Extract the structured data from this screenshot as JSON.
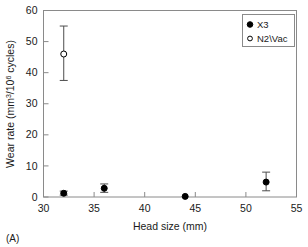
{
  "chart_data": {
    "type": "scatter",
    "title": "",
    "panel_label": "(A)",
    "xlabel": "Head size (mm)",
    "ylabel": "Wear rate (mm3/106 cycles)",
    "ylabel_parts": {
      "lead": "Wear rate (mm",
      "sup1": "3",
      "mid": "/10",
      "sup2": "6",
      "tail": " cycles)"
    },
    "xlim": [
      30,
      55
    ],
    "ylim": [
      0,
      60
    ],
    "xticks": [
      30,
      35,
      40,
      45,
      50,
      55
    ],
    "yticks": [
      0,
      10,
      20,
      30,
      40,
      50,
      60
    ],
    "xtick_labels": [
      "30",
      "35",
      "40",
      "45",
      "50",
      "55"
    ],
    "ytick_labels": [
      "0",
      "10",
      "20",
      "30",
      "40",
      "50",
      "60"
    ],
    "grid": false,
    "legend_position": "top-right",
    "series": [
      {
        "name": "X3",
        "marker": "filled-circle",
        "color": "#000000",
        "points": [
          {
            "x": 32,
            "y": 1.2,
            "yerr_low": 0.6,
            "yerr_high": 1.9
          },
          {
            "x": 36,
            "y": 2.8,
            "yerr_low": 1.5,
            "yerr_high": 4.2
          },
          {
            "x": 44,
            "y": 0.2,
            "yerr_low": 0.2,
            "yerr_high": 0.2
          },
          {
            "x": 52,
            "y": 4.8,
            "yerr_low": 2.0,
            "yerr_high": 8.0
          }
        ]
      },
      {
        "name": "N2\\Vac",
        "marker": "open-circle",
        "color": "#000000",
        "points": [
          {
            "x": 32,
            "y": 46.0,
            "yerr_low": 37.5,
            "yerr_high": 55.0
          }
        ]
      }
    ],
    "legend_entries": [
      {
        "label": "X3",
        "marker": "filled-circle"
      },
      {
        "label": "N2\\Vac",
        "marker": "open-circle"
      }
    ]
  }
}
